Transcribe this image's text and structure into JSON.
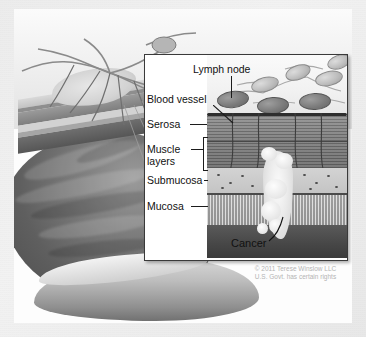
{
  "image": {
    "title": "Stages of colon cancer cross-section illustration",
    "background_color": "#ececec",
    "canvas_color": "#fdfdfd"
  },
  "inset": {
    "name": "cross-section-detail-panel",
    "border_color": "#3a3a3a",
    "labels": [
      {
        "id": "lymph-node",
        "text": "Lymph node"
      },
      {
        "id": "blood-vessel",
        "text": "Blood vessel"
      },
      {
        "id": "serosa",
        "text": "Serosa"
      },
      {
        "id": "muscle-layers-1",
        "text": "Muscle"
      },
      {
        "id": "muscle-layers-2",
        "text": "layers"
      },
      {
        "id": "submucosa",
        "text": "Submucosa"
      },
      {
        "id": "mucosa",
        "text": "Mucosa"
      },
      {
        "id": "cancer",
        "text": "Cancer"
      }
    ]
  },
  "layers": {
    "serosa": "Serosa",
    "muscle": "Muscle layers",
    "submucosa": "Submucosa",
    "mucosa": "Mucosa"
  },
  "credit": {
    "line1": "© 2011 Terese Winslow LLC",
    "line2": "U.S. Govt. has certain rights",
    "color": "#b4b4b4"
  }
}
